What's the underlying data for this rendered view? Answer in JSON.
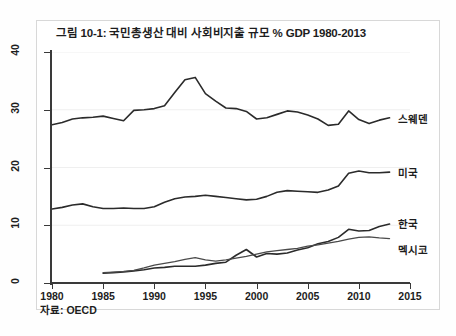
{
  "figure": {
    "title": "그림 10-1: 국민총생산 대비 사회비지출 규모 % GDP 1980-2013",
    "source": "자료: OECD"
  },
  "axes": {
    "y_ticks": [
      "0",
      "10",
      "20",
      "30",
      "40"
    ],
    "x_ticks": [
      "1980",
      "1985",
      "1990",
      "1995",
      "2000",
      "2005",
      "2010",
      "2015"
    ]
  },
  "series_labels": {
    "sweden": "스웨덴",
    "usa": "미국",
    "korea": "한국",
    "mexico": "멕시코"
  },
  "chart_data": {
    "type": "line",
    "title": "그림 10-1: 국민총생산 대비 사회비지출 규모 % GDP 1980-2013",
    "subtitle": "",
    "xlabel": "",
    "ylabel": "% GDP",
    "xlim": [
      1980,
      2015
    ],
    "ylim": [
      0,
      40
    ],
    "x_ticks": [
      1980,
      1985,
      1990,
      1995,
      2000,
      2005,
      2010,
      2015
    ],
    "y_ticks": [
      0,
      10,
      20,
      30,
      40
    ],
    "grid": "horizontal-faint",
    "legend": "inline-right-end-labels",
    "source_note": "자료: OECD",
    "series": [
      {
        "name": "스웨덴",
        "name_en": "Sweden",
        "color": "#2b2b2b",
        "linewidth": 1.6,
        "x": [
          1980,
          1981,
          1982,
          1983,
          1984,
          1985,
          1986,
          1987,
          1988,
          1989,
          1990,
          1991,
          1992,
          1993,
          1994,
          1995,
          1996,
          1997,
          1998,
          1999,
          2000,
          2001,
          2002,
          2003,
          2004,
          2005,
          2006,
          2007,
          2008,
          2009,
          2010,
          2011,
          2012,
          2013
        ],
        "values": [
          27.4,
          27.8,
          28.4,
          28.6,
          28.7,
          28.9,
          28.5,
          28.1,
          29.9,
          30.0,
          30.2,
          30.7,
          33.0,
          35.2,
          35.6,
          32.8,
          31.5,
          30.3,
          30.2,
          29.7,
          28.4,
          28.6,
          29.2,
          29.8,
          29.6,
          29.1,
          28.4,
          27.3,
          27.5,
          29.8,
          28.3,
          27.6,
          28.2,
          28.6
        ]
      },
      {
        "name": "미국",
        "name_en": "United States",
        "color": "#2b2b2b",
        "linewidth": 1.6,
        "x": [
          1980,
          1981,
          1982,
          1983,
          1984,
          1985,
          1986,
          1987,
          1988,
          1989,
          1990,
          1991,
          1992,
          1993,
          1994,
          1995,
          1996,
          1997,
          1998,
          1999,
          2000,
          2001,
          2002,
          2003,
          2004,
          2005,
          2006,
          2007,
          2008,
          2009,
          2010,
          2011,
          2012,
          2013
        ],
        "values": [
          12.8,
          13.1,
          13.5,
          13.7,
          13.2,
          12.9,
          12.9,
          13.0,
          12.9,
          12.9,
          13.2,
          14.0,
          14.6,
          14.9,
          15.0,
          15.2,
          15.0,
          14.8,
          14.6,
          14.4,
          14.5,
          15.0,
          15.7,
          16.0,
          15.9,
          15.8,
          15.7,
          16.1,
          16.8,
          19.0,
          19.4,
          19.1,
          19.1,
          19.2
        ]
      },
      {
        "name": "한국",
        "name_en": "Korea",
        "color": "#2b2b2b",
        "linewidth": 1.6,
        "x": [
          1985,
          1986,
          1987,
          1988,
          1989,
          1990,
          1991,
          1992,
          1993,
          1994,
          1995,
          1996,
          1997,
          1998,
          1999,
          2000,
          2001,
          2002,
          2003,
          2004,
          2005,
          2006,
          2007,
          2008,
          2009,
          2010,
          2011,
          2012,
          2013
        ],
        "values": [
          1.7,
          1.8,
          1.9,
          2.1,
          2.3,
          2.6,
          2.7,
          2.9,
          2.9,
          2.9,
          3.1,
          3.4,
          3.6,
          4.8,
          5.8,
          4.5,
          5.1,
          5.0,
          5.2,
          5.7,
          6.1,
          6.8,
          7.2,
          7.9,
          9.3,
          9.0,
          9.1,
          9.8,
          10.2
        ]
      },
      {
        "name": "멕시코",
        "name_en": "Mexico",
        "color": "#4a4a4a",
        "linewidth": 1.3,
        "x": [
          1985,
          1986,
          1987,
          1988,
          1989,
          1990,
          1991,
          1992,
          1993,
          1994,
          1995,
          1996,
          1997,
          1998,
          1999,
          2000,
          2001,
          2002,
          2003,
          2004,
          2005,
          2006,
          2007,
          2008,
          2009,
          2010,
          2011,
          2012,
          2013
        ],
        "values": [
          1.8,
          1.9,
          2.0,
          2.2,
          2.6,
          3.1,
          3.4,
          3.7,
          4.1,
          4.4,
          4.0,
          3.8,
          4.0,
          4.3,
          4.6,
          5.0,
          5.4,
          5.6,
          5.8,
          6.0,
          6.4,
          6.6,
          6.9,
          7.2,
          7.6,
          7.9,
          8.0,
          7.8,
          7.7
        ]
      }
    ]
  }
}
